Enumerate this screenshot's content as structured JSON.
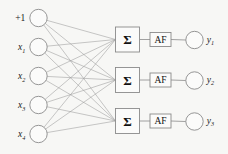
{
  "figure": {
    "background_color": "#f7f7f5",
    "stroke_color": "#8a8a8a",
    "edge_color": "#9a9a9a",
    "text_color": "#1a1a1a"
  },
  "input_layer": {
    "name": "input-layer",
    "nodes": [
      {
        "label_main": "+1",
        "label_sub": "",
        "italic": false,
        "cx": 38.5,
        "cy": 18,
        "r": 8.7
      },
      {
        "label_main": "x",
        "label_sub": "1",
        "italic": true,
        "cx": 38.5,
        "cy": 47,
        "r": 8.7
      },
      {
        "label_main": "x",
        "label_sub": "2",
        "italic": true,
        "cx": 38.5,
        "cy": 76,
        "r": 8.7
      },
      {
        "label_main": "x",
        "label_sub": "3",
        "italic": true,
        "cx": 38.5,
        "cy": 105,
        "r": 8.7
      },
      {
        "label_main": "x",
        "label_sub": "4",
        "italic": true,
        "cx": 38.5,
        "cy": 134,
        "r": 8.7
      }
    ]
  },
  "processing_rows": {
    "name": "processing-rows",
    "sum_symbol": "Σ",
    "activation_label": "AF",
    "rows": [
      {
        "sum_box": {
          "x": 115.5,
          "y": 27.0,
          "w": 24,
          "h": 25
        },
        "af_box": {
          "x": 150.0,
          "y": 32.5,
          "w": 21,
          "h": 14
        },
        "out_node": {
          "cx": 194.5,
          "cy": 40.0,
          "r": 8.7
        },
        "out_label_main": "y",
        "out_label_sub": "1"
      },
      {
        "sum_box": {
          "x": 115.5,
          "y": 67.5,
          "w": 24,
          "h": 25
        },
        "af_box": {
          "x": 150.0,
          "y": 73.0,
          "w": 21,
          "h": 14
        },
        "out_node": {
          "cx": 194.5,
          "cy": 80.5,
          "r": 8.7
        },
        "out_label_main": "y",
        "out_label_sub": "2"
      },
      {
        "sum_box": {
          "x": 115.5,
          "y": 108.5,
          "w": 24,
          "h": 25
        },
        "af_box": {
          "x": 150.0,
          "y": 114.0,
          "w": 21,
          "h": 14
        },
        "out_node": {
          "cx": 194.5,
          "cy": 121.5,
          "r": 8.7
        },
        "out_label_main": "y",
        "out_label_sub": "3"
      }
    ]
  },
  "connections": {
    "name": "fully-connected-edges",
    "description": "every input node connects to every summation unit",
    "count": 15
  }
}
